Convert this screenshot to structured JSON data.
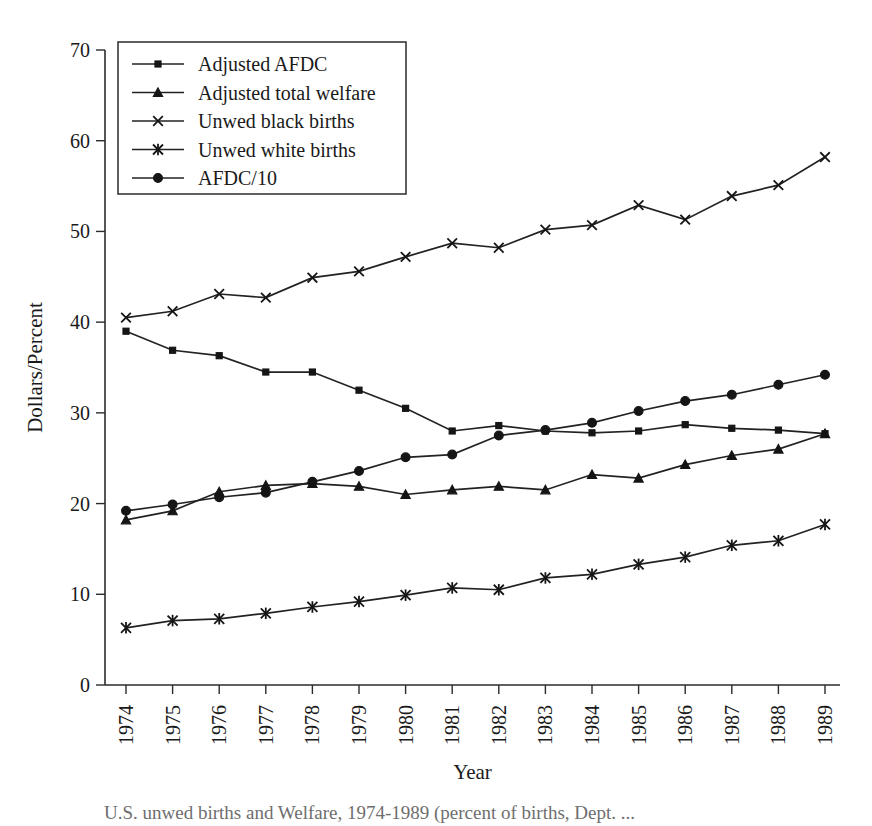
{
  "chart_data": {
    "type": "line",
    "title": "",
    "xlabel": "Year",
    "ylabel": "Dollars/Percent",
    "categories": [
      "1974",
      "1975",
      "1976",
      "1977",
      "1978",
      "1979",
      "1980",
      "1981",
      "1982",
      "1983",
      "1984",
      "1985",
      "1986",
      "1987",
      "1988",
      "1989"
    ],
    "x": [
      1974,
      1975,
      1976,
      1977,
      1978,
      1979,
      1980,
      1981,
      1982,
      1983,
      1984,
      1985,
      1986,
      1987,
      1988,
      1989
    ],
    "ylim": [
      0,
      70
    ],
    "yticks": [
      0,
      10,
      20,
      30,
      40,
      50,
      60,
      70
    ],
    "grid": false,
    "legend_position": "top-left",
    "series": [
      {
        "name": "Adjusted AFDC",
        "marker": "square",
        "values": [
          39.0,
          36.9,
          36.3,
          34.5,
          34.5,
          32.5,
          30.5,
          28.0,
          28.6,
          28.0,
          27.8,
          28.0,
          28.7,
          28.3,
          28.1,
          27.7
        ]
      },
      {
        "name": "Adjusted total welfare",
        "marker": "triangle",
        "values": [
          18.2,
          19.2,
          21.3,
          22.0,
          22.2,
          21.9,
          21.0,
          21.5,
          21.9,
          21.5,
          23.2,
          22.8,
          24.3,
          25.3,
          26.0,
          27.7
        ]
      },
      {
        "name": "Unwed black births",
        "marker": "x",
        "values": [
          40.5,
          41.2,
          43.1,
          42.7,
          44.9,
          45.6,
          47.2,
          48.7,
          48.2,
          50.2,
          50.7,
          52.9,
          51.3,
          53.9,
          55.1,
          58.2
        ]
      },
      {
        "name": "Unwed white births",
        "marker": "asterisk",
        "values": [
          6.3,
          7.1,
          7.3,
          7.9,
          8.6,
          9.2,
          9.9,
          10.7,
          10.5,
          11.8,
          12.2,
          13.3,
          14.1,
          15.4,
          15.9,
          17.7
        ]
      },
      {
        "name": "AFDC/10",
        "marker": "circle",
        "values": [
          19.2,
          19.9,
          20.7,
          21.2,
          22.4,
          23.6,
          25.1,
          25.4,
          27.5,
          28.1,
          28.9,
          30.2,
          31.3,
          32.0,
          33.1,
          34.2
        ]
      }
    ]
  },
  "axes": {
    "y_title": "Dollars/Percent",
    "x_title": "Year"
  },
  "legend": {
    "entries": [
      {
        "label": "Adjusted AFDC",
        "marker": "square"
      },
      {
        "label": "Adjusted total welfare",
        "marker": "triangle"
      },
      {
        "label": "Unwed black births",
        "marker": "x"
      },
      {
        "label": "Unwed white births",
        "marker": "asterisk"
      },
      {
        "label": "AFDC/10",
        "marker": "circle"
      }
    ]
  },
  "caption": {
    "text": "U.S. unwed births and Welfare, 1974-1989 (percent of births, Dept. ..."
  }
}
